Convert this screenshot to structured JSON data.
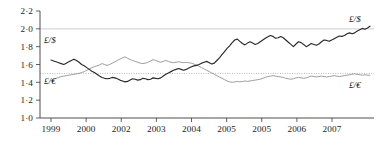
{
  "chart_data": {
    "type": "line",
    "title": "",
    "subtitle": "",
    "xlabel": "",
    "ylabel": "",
    "ylim": [
      1.0,
      2.2
    ],
    "grid": "horizontal reference lines at 2.0 (light solid) and 1.5 (dotted)",
    "legend_position": "inline labels at line ends",
    "y_ticks": [
      "2·2",
      "2·0",
      "1·8",
      "1·6",
      "1·4",
      "1·2",
      "1·0"
    ],
    "y_tick_values": [
      2.2,
      2.0,
      1.8,
      1.6,
      1.4,
      1.2,
      1.0
    ],
    "x_tick_labels": [
      "1999",
      "2000",
      "2002",
      "2003",
      "2004",
      "2005",
      "2005",
      "2006",
      "2007"
    ],
    "gridline_values": [
      2.0,
      1.5
    ],
    "series": [
      {
        "name": "£/$",
        "label_left": "£/$",
        "label_right": "£/$",
        "color": "#2a2a2a",
        "style": "solid",
        "values": [
          1.65,
          1.64,
          1.63,
          1.62,
          1.61,
          1.6,
          1.615,
          1.63,
          1.645,
          1.66,
          1.645,
          1.625,
          1.6,
          1.585,
          1.565,
          1.545,
          1.525,
          1.51,
          1.49,
          1.47,
          1.455,
          1.445,
          1.44,
          1.445,
          1.455,
          1.45,
          1.44,
          1.425,
          1.415,
          1.405,
          1.41,
          1.425,
          1.44,
          1.435,
          1.425,
          1.43,
          1.445,
          1.44,
          1.43,
          1.435,
          1.45,
          1.445,
          1.44,
          1.45,
          1.47,
          1.49,
          1.505,
          1.52,
          1.535,
          1.545,
          1.555,
          1.545,
          1.535,
          1.545,
          1.56,
          1.575,
          1.585,
          1.59,
          1.6,
          1.615,
          1.625,
          1.635,
          1.62,
          1.605,
          1.615,
          1.645,
          1.675,
          1.71,
          1.745,
          1.78,
          1.81,
          1.845,
          1.875,
          1.885,
          1.86,
          1.835,
          1.82,
          1.84,
          1.855,
          1.84,
          1.825,
          1.835,
          1.855,
          1.875,
          1.895,
          1.91,
          1.925,
          1.915,
          1.895,
          1.9,
          1.915,
          1.9,
          1.875,
          1.85,
          1.825,
          1.8,
          1.83,
          1.855,
          1.845,
          1.825,
          1.8,
          1.815,
          1.835,
          1.825,
          1.815,
          1.83,
          1.855,
          1.875,
          1.87,
          1.86,
          1.875,
          1.89,
          1.905,
          1.92,
          1.915,
          1.925,
          1.945,
          1.955,
          1.945,
          1.955,
          1.975,
          1.99,
          2.005,
          1.995,
          2.01,
          2.03
        ]
      },
      {
        "name": "£/€",
        "label_left": "£/€",
        "label_right": "£/€",
        "color": "#8c8c8c",
        "style": "light",
        "values": [
          1.42,
          1.435,
          1.445,
          1.455,
          1.465,
          1.47,
          1.475,
          1.48,
          1.485,
          1.49,
          1.495,
          1.5,
          1.51,
          1.52,
          1.535,
          1.55,
          1.565,
          1.575,
          1.585,
          1.595,
          1.61,
          1.6,
          1.59,
          1.6,
          1.615,
          1.63,
          1.645,
          1.66,
          1.675,
          1.685,
          1.67,
          1.655,
          1.645,
          1.635,
          1.625,
          1.615,
          1.61,
          1.615,
          1.625,
          1.64,
          1.655,
          1.645,
          1.635,
          1.625,
          1.635,
          1.645,
          1.635,
          1.625,
          1.62,
          1.625,
          1.63,
          1.625,
          1.62,
          1.625,
          1.62,
          1.615,
          1.605,
          1.595,
          1.58,
          1.565,
          1.55,
          1.535,
          1.52,
          1.505,
          1.49,
          1.475,
          1.46,
          1.445,
          1.43,
          1.415,
          1.405,
          1.4,
          1.405,
          1.41,
          1.405,
          1.41,
          1.415,
          1.41,
          1.415,
          1.42,
          1.425,
          1.43,
          1.435,
          1.445,
          1.455,
          1.465,
          1.47,
          1.475,
          1.47,
          1.465,
          1.46,
          1.455,
          1.445,
          1.44,
          1.435,
          1.44,
          1.45,
          1.455,
          1.45,
          1.445,
          1.45,
          1.46,
          1.47,
          1.465,
          1.46,
          1.465,
          1.47,
          1.465,
          1.46,
          1.465,
          1.47,
          1.475,
          1.47,
          1.465,
          1.47,
          1.475,
          1.48,
          1.485,
          1.49,
          1.495,
          1.49,
          1.485,
          1.48,
          1.485,
          1.48,
          1.48
        ]
      }
    ]
  }
}
